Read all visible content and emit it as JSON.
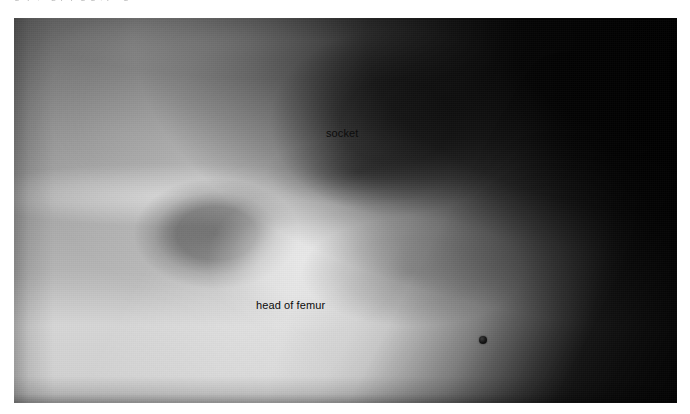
{
  "page": {
    "background_color": "#ffffff",
    "clipped_caption_remnant": "Fig.  p  ,  f g   p            p     g          g  ,   p   f   g"
  },
  "figure": {
    "type": "radiograph",
    "modality": "X-ray",
    "view": "anteroposterior hip",
    "frame": {
      "x": 14,
      "y": 18,
      "width": 663,
      "height": 385
    },
    "annotations": [
      {
        "id": "socket",
        "label": "socket",
        "x": 312,
        "y": 110,
        "anatomy": "acetabulum"
      },
      {
        "id": "head-of-femur",
        "label": "head of femur",
        "x": 242,
        "y": 282,
        "anatomy": "femoral head"
      }
    ],
    "markers": [
      {
        "id": "radiopaque-bead",
        "shape": "circle",
        "x": 465,
        "y": 318,
        "diameter": 8,
        "color": "#0c0c0c"
      }
    ],
    "tones": {
      "film_base": "#777777",
      "bone_bright": "#d8d8d8",
      "soft_tissue_mid": "#8d8d8d",
      "air_dark": "#060606",
      "label_color": "#0c0c0c"
    }
  }
}
